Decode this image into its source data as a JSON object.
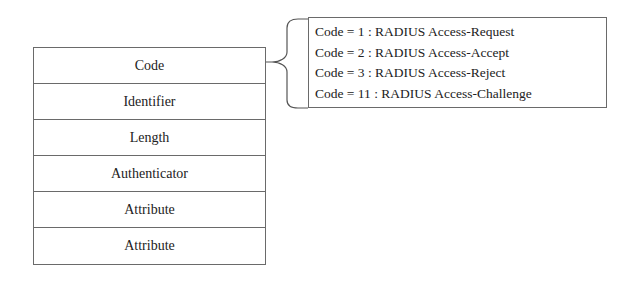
{
  "packet": {
    "fields": [
      {
        "label": "Code"
      },
      {
        "label": "Identifier"
      },
      {
        "label": "Length"
      },
      {
        "label": "Authenticator"
      },
      {
        "label": "Attribute"
      },
      {
        "label": "Attribute"
      }
    ]
  },
  "callout": {
    "lines": [
      "Code = 1 : RADIUS Access-Request",
      "Code = 2 : RADIUS Access-Accept",
      "Code = 3 : RADIUS Access-Reject",
      "Code = 11 : RADIUS Access-Challenge"
    ]
  }
}
